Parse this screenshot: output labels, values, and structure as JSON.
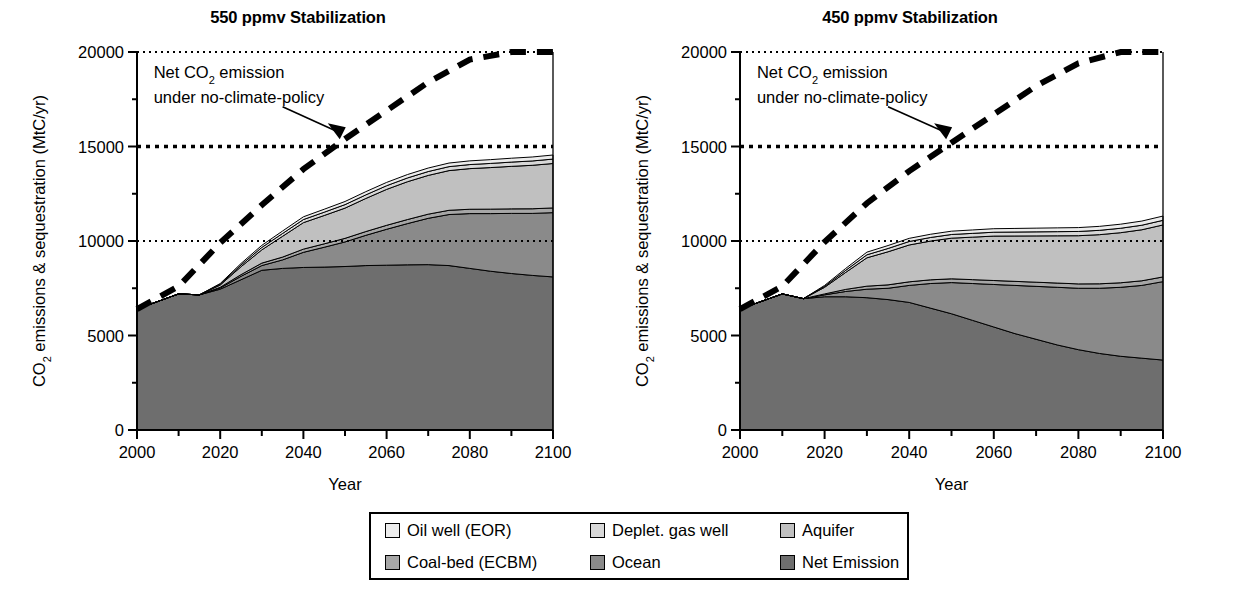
{
  "figure": {
    "axis_label_y": "CO2 emissions & sequestration (MtC/yr)",
    "axis_label_y_pre": "CO",
    "axis_label_y_sub": "2",
    "axis_label_y_post": " emissions & sequestration (MtC/yr)",
    "axis_label_x": "Year"
  },
  "annotation": {
    "line1_pre": "Net CO",
    "line1_sub": "2",
    "line1_post": " emission",
    "line2": "under no-climate-policy"
  },
  "legend": {
    "items": [
      {
        "label": "Oil well (EOR)",
        "color": "#ececec"
      },
      {
        "label": "Deplet. gas well",
        "color": "#d8d8d8"
      },
      {
        "label": "Aquifer",
        "color": "#c0c0c0"
      },
      {
        "label": "Coal-bed (ECBM)",
        "color": "#a6a6a6"
      },
      {
        "label": "Ocean",
        "color": "#8a8a8a"
      },
      {
        "label": "Net Emission",
        "color": "#6e6e6e"
      }
    ]
  },
  "chart_data": [
    {
      "type": "area",
      "id": "panel-550",
      "title": "550 ppmv Stabilization",
      "xlabel": "Year",
      "ylabel": "CO2 emissions & sequestration (MtC/yr)",
      "xlim": [
        2000,
        2100
      ],
      "ylim": [
        0,
        20000
      ],
      "xticks": [
        2000,
        2020,
        2040,
        2060,
        2080,
        2100
      ],
      "xtick_labels": [
        "2000",
        "2020",
        "2040",
        "2060",
        "2080",
        "2100"
      ],
      "xminor_step": 10,
      "yticks": [
        0,
        5000,
        10000,
        15000,
        20000
      ],
      "ytick_labels": [
        "0",
        "5000",
        "10000",
        "15000",
        "20000"
      ],
      "yminor_step": 2500,
      "grid": "dotted horizontal at 10000, 15000, 20000",
      "legend_position": "below figure, shared",
      "stacked": true,
      "x": [
        2000,
        2005,
        2010,
        2015,
        2020,
        2025,
        2030,
        2035,
        2040,
        2045,
        2050,
        2055,
        2060,
        2065,
        2070,
        2075,
        2080,
        2085,
        2090,
        2095,
        2100
      ],
      "series": [
        {
          "name": "Net Emission",
          "color": "#6e6e6e",
          "values": [
            6400,
            6800,
            7200,
            7150,
            7450,
            7950,
            8450,
            8550,
            8600,
            8620,
            8650,
            8700,
            8720,
            8740,
            8750,
            8700,
            8550,
            8400,
            8280,
            8180,
            8100
          ]
        },
        {
          "name": "Ocean",
          "color": "#8a8a8a",
          "values": [
            0,
            0,
            0,
            0,
            60,
            180,
            250,
            450,
            800,
            1050,
            1300,
            1600,
            1900,
            2180,
            2450,
            2700,
            2900,
            3050,
            3180,
            3280,
            3400
          ]
        },
        {
          "name": "Coal-bed (ECBM)",
          "color": "#a6a6a6",
          "values": [
            0,
            0,
            0,
            0,
            40,
            90,
            130,
            150,
            170,
            180,
            190,
            200,
            210,
            215,
            220,
            225,
            230,
            235,
            240,
            245,
            250
          ]
        },
        {
          "name": "Aquifer",
          "color": "#c0c0c0",
          "values": [
            0,
            0,
            0,
            0,
            120,
            420,
            700,
            1100,
            1400,
            1500,
            1600,
            1750,
            1900,
            2000,
            2050,
            2100,
            2150,
            2200,
            2250,
            2300,
            2350
          ]
        },
        {
          "name": "Deplet. gas well",
          "color": "#d8d8d8",
          "values": [
            0,
            0,
            0,
            0,
            40,
            90,
            130,
            150,
            165,
            175,
            185,
            190,
            195,
            200,
            205,
            210,
            215,
            220,
            225,
            230,
            235
          ]
        },
        {
          "name": "Oil well (EOR)",
          "color": "#ececec",
          "values": [
            0,
            0,
            0,
            0,
            40,
            80,
            110,
            130,
            145,
            155,
            165,
            170,
            175,
            180,
            185,
            190,
            195,
            200,
            205,
            210,
            215
          ]
        }
      ],
      "reference_line": {
        "name": "Net CO2 emission under no-climate-policy",
        "style": "thick dashed",
        "x": [
          2000,
          2010,
          2020,
          2030,
          2040,
          2050,
          2060,
          2070,
          2080,
          2090,
          2100
        ],
        "y": [
          6400,
          7600,
          9900,
          11900,
          13800,
          15400,
          16900,
          18400,
          19600,
          20000,
          20000
        ]
      }
    },
    {
      "type": "area",
      "id": "panel-450",
      "title": "450 ppmv Stabilization",
      "xlabel": "Year",
      "ylabel": "CO2 emissions & sequestration (MtC/yr)",
      "xlim": [
        2000,
        2100
      ],
      "ylim": [
        0,
        20000
      ],
      "xticks": [
        2000,
        2020,
        2040,
        2060,
        2080,
        2100
      ],
      "xtick_labels": [
        "2000",
        "2020",
        "2040",
        "2060",
        "2080",
        "2100"
      ],
      "xminor_step": 10,
      "yticks": [
        0,
        5000,
        10000,
        15000,
        20000
      ],
      "ytick_labels": [
        "0",
        "5000",
        "10000",
        "15000",
        "20000"
      ],
      "yminor_step": 2500,
      "grid": "dotted horizontal at 10000, 15000, 20000",
      "legend_position": "below figure, shared",
      "stacked": true,
      "x": [
        2000,
        2005,
        2010,
        2015,
        2020,
        2025,
        2030,
        2035,
        2040,
        2045,
        2050,
        2055,
        2060,
        2065,
        2070,
        2075,
        2080,
        2085,
        2090,
        2095,
        2100
      ],
      "series": [
        {
          "name": "Net Emission",
          "color": "#6e6e6e",
          "values": [
            6400,
            6800,
            7200,
            6950,
            7050,
            7050,
            7000,
            6900,
            6750,
            6450,
            6150,
            5800,
            5450,
            5100,
            4800,
            4500,
            4250,
            4050,
            3900,
            3800,
            3700
          ]
        },
        {
          "name": "Ocean",
          "color": "#8a8a8a",
          "values": [
            0,
            0,
            0,
            0,
            100,
            280,
            450,
            600,
            900,
            1300,
            1650,
            1950,
            2250,
            2550,
            2800,
            3050,
            3250,
            3450,
            3650,
            3850,
            4150
          ]
        },
        {
          "name": "Coal-bed (ECBM)",
          "color": "#a6a6a6",
          "values": [
            0,
            0,
            0,
            0,
            50,
            110,
            160,
            180,
            190,
            195,
            200,
            205,
            210,
            215,
            220,
            225,
            230,
            235,
            240,
            245,
            250
          ]
        },
        {
          "name": "Aquifer",
          "color": "#c0c0c0",
          "values": [
            0,
            0,
            0,
            0,
            350,
            900,
            1500,
            1750,
            1950,
            2050,
            2150,
            2250,
            2350,
            2400,
            2450,
            2500,
            2550,
            2600,
            2650,
            2700,
            2750
          ]
        },
        {
          "name": "Deplet. gas well",
          "color": "#d8d8d8",
          "values": [
            0,
            0,
            0,
            0,
            50,
            110,
            160,
            175,
            185,
            190,
            195,
            200,
            205,
            210,
            215,
            220,
            225,
            230,
            235,
            240,
            245
          ]
        },
        {
          "name": "Oil well (EOR)",
          "color": "#ececec",
          "values": [
            0,
            0,
            0,
            0,
            50,
            100,
            140,
            155,
            165,
            170,
            175,
            180,
            185,
            190,
            195,
            200,
            205,
            210,
            215,
            220,
            225
          ]
        }
      ],
      "reference_line": {
        "name": "Net CO2 emission under no-climate-policy",
        "style": "thick dashed",
        "x": [
          2000,
          2010,
          2020,
          2030,
          2040,
          2050,
          2060,
          2070,
          2080,
          2090,
          2100
        ],
        "y": [
          6400,
          7600,
          9950,
          12000,
          13700,
          15200,
          16700,
          18200,
          19400,
          20000,
          20000
        ]
      }
    }
  ]
}
